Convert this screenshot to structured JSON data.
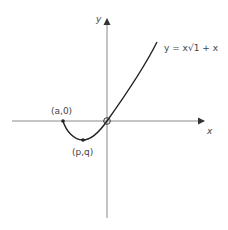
{
  "diagram": {
    "title": "",
    "axes": {
      "x_label": "x",
      "y_label": "y"
    },
    "curve": {
      "equation_label": "y = x√1 + x",
      "equation_parts": {
        "lhs": "y",
        "eq": "=",
        "x": "x",
        "radical": "√",
        "radicand": "1 + x"
      }
    },
    "points": [
      {
        "label": "(a,0)",
        "description": "x-intercept left endpoint"
      },
      {
        "label": "(p,q)",
        "description": "minimum point"
      },
      {
        "label": "",
        "description": "origin (open circle)"
      }
    ],
    "colors": {
      "axis": "#8a8a8a",
      "curve": "#222222",
      "text": "#444444"
    }
  }
}
